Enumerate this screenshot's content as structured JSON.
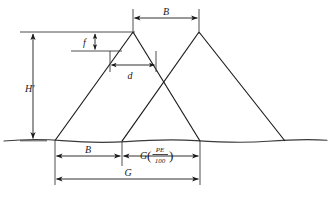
{
  "figure": {
    "type": "engineering-cross-section-diagram"
  },
  "colors": {
    "line": "#1a1a1a",
    "ground": "#3a3a3a",
    "background": "#ffffff",
    "dimension": "#1a1a1a"
  },
  "labels": {
    "height_total": "H'",
    "crest_offset": "f",
    "crest_width": "d",
    "burden": "B",
    "burden_bottom": "B",
    "spacing_fraction_lead": "G",
    "spacing_fraction_numerator": "PE",
    "spacing_fraction_denominator": "100",
    "paren_open": "(",
    "paren_close": ")",
    "total_spacing": "G"
  },
  "geometry": {
    "ground_y": 140,
    "apex_left_x": 133,
    "apex_right_x": 199,
    "apex_y": 32,
    "foot_1_x": 55,
    "foot_2_x": 122,
    "foot_3_x": 200,
    "foot_4_x": 285,
    "f_line_y": 51,
    "top_dim_y": 16,
    "b_bottom_dim_y": 155,
    "g_dim_y": 178
  },
  "dimensions": [
    {
      "name": "H-prime",
      "label": "H'",
      "orientation": "vertical",
      "from_y": 32,
      "to_y": 140
    },
    {
      "name": "f",
      "label": "f",
      "orientation": "vertical",
      "from_y": 32,
      "to_y": 51
    },
    {
      "name": "d",
      "label": "d",
      "orientation": "horizontal",
      "from_x": 110,
      "to_x": 156
    },
    {
      "name": "B-top",
      "label": "B",
      "orientation": "horizontal",
      "from_x": 133,
      "to_x": 199
    },
    {
      "name": "B-bottom",
      "label": "B",
      "orientation": "horizontal",
      "from_x": 55,
      "to_x": 122
    },
    {
      "name": "G-PE-100",
      "label": "G(PE/100)",
      "orientation": "horizontal",
      "from_x": 122,
      "to_x": 200
    },
    {
      "name": "G-total",
      "label": "G",
      "orientation": "horizontal",
      "from_x": 55,
      "to_x": 200
    }
  ]
}
